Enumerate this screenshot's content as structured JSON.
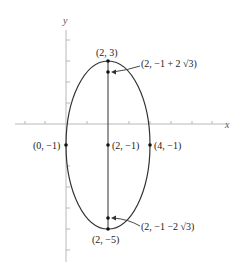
{
  "axes": {
    "x_label": "x",
    "y_label": "y"
  },
  "ellipse": {
    "center": [
      2,
      -1
    ],
    "semi_axis_x": 2,
    "semi_axis_y": 4
  },
  "points": [
    {
      "id": "top-vertex",
      "coords": [
        2,
        3
      ],
      "label": "(2, 3)"
    },
    {
      "id": "upper-focus",
      "coords": [
        2,
        2.464
      ],
      "label": "(2, −1 + 2 √3)"
    },
    {
      "id": "left-covertex",
      "coords": [
        0,
        -1
      ],
      "label": "(0, −1)"
    },
    {
      "id": "center",
      "coords": [
        2,
        -1
      ],
      "label": "(2, −1)"
    },
    {
      "id": "right-covertex",
      "coords": [
        4,
        -1
      ],
      "label": "(4, −1)"
    },
    {
      "id": "lower-focus",
      "coords": [
        2,
        -4.464
      ],
      "label": "(2, −1 −2 √3)"
    },
    {
      "id": "bottom-vertex",
      "coords": [
        2,
        -5
      ],
      "label": "(2, −5)"
    }
  ],
  "colors": {
    "curve": "#333333",
    "axis": "#b0b0b0"
  }
}
